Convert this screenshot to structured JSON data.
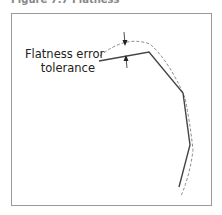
{
  "figure": {
    "caption": "Figure 7.7 Flatness",
    "label_line1": "Flatness error",
    "label_line2": "tolerance",
    "colors": {
      "frame": "#999999",
      "polyline": "#444444",
      "curve": "#888888",
      "arrow": "#222222"
    }
  }
}
